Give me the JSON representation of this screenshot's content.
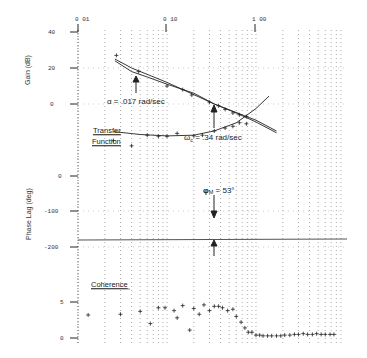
{
  "chart_data": [
    {
      "type": "line",
      "panel": "gain",
      "title": "Transfer Function",
      "xlabel": "Frequency (rad/sec)",
      "ylabel": "Gain (dB)",
      "xscale": "log",
      "xlim": [
        0.01,
        10
      ],
      "x_tick_labels": [
        "0 01",
        "0 10",
        "1 00"
      ],
      "x_ticks": [
        0.01,
        0.1,
        1.0
      ],
      "ylim": [
        -20,
        40
      ],
      "y_tick_labels": [
        "40",
        "20",
        "0"
      ],
      "y_ticks": [
        40,
        20,
        0
      ],
      "grid": "dotted",
      "series": [
        {
          "name": "measured",
          "style": "cross",
          "x": [
            0.027,
            0.048,
            0.1,
            0.15,
            0.19,
            0.3,
            0.38,
            0.45,
            0.55,
            0.65,
            0.78
          ],
          "y": [
            27,
            18,
            10,
            8,
            5,
            1,
            -1,
            -3,
            -5,
            -6,
            -7
          ]
        },
        {
          "name": "model_fit",
          "style": "line",
          "x": [
            0.026,
            0.04,
            0.06,
            0.1,
            0.2,
            0.34,
            0.6,
            1.0,
            1.7
          ],
          "y": [
            24,
            18,
            15,
            11,
            6,
            0,
            -5,
            -10,
            -16
          ]
        },
        {
          "name": "asymptote",
          "style": "line",
          "x": [
            0.026,
            0.04,
            0.1,
            0.34,
            1.0,
            1.7
          ],
          "y": [
            25,
            20,
            12,
            0,
            -9,
            -15
          ]
        }
      ],
      "annotations": [
        {
          "text": "α = .017 rad/sec",
          "x": 0.04,
          "y": 14,
          "arrow": "up"
        },
        {
          "text": "ωc = .34 rad/sec",
          "x": 0.34,
          "y": 0,
          "arrow": "up"
        }
      ]
    },
    {
      "type": "line",
      "panel": "phase",
      "xlabel": "Frequency (rad/sec)",
      "ylabel": "Phase Lag (deg)",
      "xscale": "log",
      "xlim": [
        0.01,
        10
      ],
      "ylim": [
        -250,
        0
      ],
      "y_tick_labels": [
        "0",
        "-100",
        "-200"
      ],
      "y_ticks": [
        0,
        -100,
        -200
      ],
      "grid": "dotted",
      "series": [
        {
          "name": "measured",
          "style": "cross",
          "x": [
            0.025,
            0.04,
            0.06,
            0.08,
            0.1,
            0.13,
            0.2,
            0.25,
            0.34,
            0.45,
            0.55,
            0.65,
            0.78
          ],
          "y": [
            -100,
            -85,
            -115,
            -112,
            -112,
            -120,
            -113,
            -115,
            -127,
            -135,
            -140,
            -150,
            -147
          ]
        },
        {
          "name": "model_fit",
          "style": "line",
          "x": [
            0.025,
            0.05,
            0.1,
            0.2,
            0.34,
            0.6,
            1.0,
            1.4
          ],
          "y": [
            -125,
            -117,
            -113,
            -115,
            -127,
            -150,
            -190,
            -225
          ]
        },
        {
          "name": "-180 reference",
          "style": "line",
          "x": [
            0.01,
            10
          ],
          "y": [
            -180,
            -180
          ]
        }
      ],
      "annotations": [
        {
          "text": "φM = 53°",
          "x": 0.34,
          "y": -127,
          "arrow": "down"
        }
      ]
    },
    {
      "type": "scatter",
      "panel": "coherence",
      "title": "Coherence",
      "xscale": "log",
      "xlim": [
        0.01,
        10
      ],
      "ylim": [
        0,
        1
      ],
      "y_tick_labels": [
        "5",
        "0"
      ],
      "y_ticks": [
        0.5,
        0
      ],
      "series": [
        {
          "name": "coherence",
          "style": "cross",
          "x": [
            0.013,
            0.03,
            0.05,
            0.065,
            0.08,
            0.095,
            0.12,
            0.13,
            0.15,
            0.18,
            0.2,
            0.23,
            0.26,
            0.3,
            0.34,
            0.38,
            0.42,
            0.48,
            0.55,
            0.6,
            0.68,
            0.75,
            0.82,
            0.9,
            1.0,
            1.1,
            1.2,
            1.35,
            1.5,
            1.7,
            1.9,
            2.1,
            2.4,
            2.7,
            3.0,
            3.4,
            3.8,
            4.3,
            4.8,
            5.4,
            6.0,
            6.8,
            7.5
          ],
          "y": [
            0.32,
            0.33,
            0.37,
            0.2,
            0.42,
            0.42,
            0.38,
            0.28,
            0.45,
            0.11,
            0.41,
            0.33,
            0.46,
            0.38,
            0.44,
            0.44,
            0.42,
            0.38,
            0.4,
            0.3,
            0.22,
            0.14,
            0.08,
            0.08,
            0.04,
            0.04,
            0.03,
            0.03,
            0.03,
            0.03,
            0.03,
            0.04,
            0.04,
            0.05,
            0.05,
            0.06,
            0.05,
            0.05,
            0.06,
            0.05,
            0.05,
            0.05,
            0.05
          ]
        }
      ]
    }
  ],
  "labels": {
    "x_tick_001": "0 01",
    "x_tick_010": "0 10",
    "x_tick_100": "1 00",
    "gain_axis": "Gain (dB)",
    "gain_40": "40",
    "gain_20": "20",
    "gain_0": "0",
    "phase_axis": "Phase Lag (deg)",
    "phase_0": "0",
    "phase_m100": "-100",
    "phase_m200": "-200",
    "coh_5": "5",
    "coh_0": "0",
    "alpha_annot": "α =  .017 rad/sec",
    "wc_annot_prefix": "ω",
    "wc_annot_sub": "c",
    "wc_annot_rest": " =  .34 rad/sec",
    "phi_prefix": "φ",
    "phi_sub": "M",
    "phi_rest": " = 53°",
    "transfer": "Transfer",
    "function": "Function",
    "coherence": "Coherence"
  }
}
